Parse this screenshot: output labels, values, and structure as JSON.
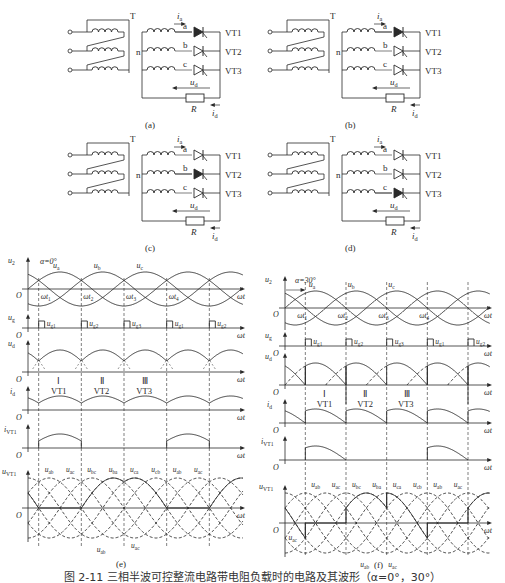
{
  "circuits": [
    {
      "id": "a",
      "label": "(a)",
      "transformer": "T",
      "neutral": "n",
      "phases": [
        "a",
        "b",
        "c"
      ],
      "thyristors": [
        "VT1",
        "VT2",
        "VT3"
      ],
      "current_in": "i",
      "current_in_sub": "a",
      "load_voltage": "u",
      "load_voltage_sub": "d",
      "load_current": "i",
      "load_current_sub": "d",
      "resistor": "R",
      "active_phase": "a"
    },
    {
      "id": "b",
      "label": "(b)",
      "transformer": "T",
      "neutral": "n",
      "phases": [
        "a",
        "b",
        "c"
      ],
      "thyristors": [
        "VT1",
        "VT2",
        "VT3"
      ],
      "current_in": "i",
      "current_in_sub": "a",
      "load_voltage": "u",
      "load_voltage_sub": "d",
      "load_current": "i",
      "load_current_sub": "d",
      "resistor": "R",
      "active_phase": "a"
    },
    {
      "id": "c",
      "label": "(c)",
      "transformer": "T",
      "neutral": "n",
      "phases": [
        "a",
        "b",
        "c"
      ],
      "thyristors": [
        "VT1",
        "VT2",
        "VT3"
      ],
      "current_in": "i",
      "current_in_sub": "a",
      "load_voltage": "u",
      "load_voltage_sub": "d",
      "load_current": "i",
      "load_current_sub": "d",
      "resistor": "R",
      "active_phase": "b"
    },
    {
      "id": "d",
      "label": "(d)",
      "transformer": "T",
      "neutral": "n",
      "phases": [
        "a",
        "b",
        "c"
      ],
      "thyristors": [
        "VT1",
        "VT2",
        "VT3"
      ],
      "current_in": "i",
      "current_in_sub": "a",
      "load_voltage": "u",
      "load_voltage_sub": "d",
      "load_current": "i",
      "load_current_sub": "d",
      "resistor": "R",
      "active_phase": "c"
    }
  ],
  "waveforms": [
    {
      "id": "e",
      "label": "(e)",
      "alpha_label": "α=0°",
      "phase_labels": [
        "u_a",
        "u_b",
        "u_c"
      ],
      "wt_labels": [
        "ωt1",
        "ωt2",
        "ωt3",
        "ωt4"
      ],
      "gate_labels": [
        "u_g1",
        "u_g2",
        "u_g3",
        "u_g1",
        "u_g2"
      ],
      "conduction_roman": [
        "Ⅰ",
        "Ⅱ",
        "Ⅲ"
      ],
      "conduction_devices": [
        "VT1",
        "VT2",
        "VT3"
      ],
      "line_voltage_labels": [
        "u_ab",
        "u_ac",
        "u_bc",
        "u_ba",
        "u_ca",
        "u_cb",
        "u_ab",
        "u_ac"
      ],
      "bottom_labels": [
        "u_ab",
        "u_ac"
      ],
      "axis_x": "ωt",
      "axis_y": [
        "u2",
        "ug",
        "ud",
        "id",
        "iVT1",
        "uVT1"
      ],
      "origin": "O"
    },
    {
      "id": "f",
      "label": "(f)",
      "alpha_label": "α=30°",
      "phase_labels": [
        "u_a",
        "u_b",
        "u_c"
      ],
      "wt_labels": [
        "ωt1",
        "ωt2",
        "ωt3",
        "ωt4"
      ],
      "gate_labels": [
        "u_g1",
        "u_g2",
        "u_g3",
        "u_g1",
        "u_g2"
      ],
      "conduction_roman": [
        "Ⅰ",
        "Ⅱ",
        "Ⅲ"
      ],
      "conduction_devices": [
        "VT1",
        "VT2",
        "VT3"
      ],
      "line_voltage_labels": [
        "u_ab",
        "u_ac",
        "u_bc",
        "u_ba",
        "u_ca",
        "u_cb",
        "u_ab",
        "u_ac"
      ],
      "bottom_labels": [
        "u_ac",
        "u_ab",
        "u_ac"
      ],
      "axis_x": "ωt",
      "axis_y": [
        "u2",
        "ug",
        "ud",
        "id",
        "iVT1",
        "uVT1"
      ],
      "origin": "O"
    }
  ],
  "caption": "图 2-11   三相半波可控整流电路带电阻负载时的电路及其波形（α=0°，30°）"
}
